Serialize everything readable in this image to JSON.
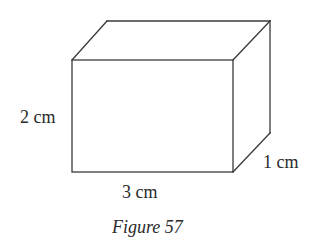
{
  "figure": {
    "caption": "Figure 57",
    "shape": "rectangular prism (cuboid)",
    "dimensions": {
      "height_label": "2 cm",
      "length_label": "3 cm",
      "depth_label": "1 cm"
    },
    "colors": {
      "line": "#3a3a3a",
      "text": "#2a2a2a",
      "background": "#ffffff"
    }
  }
}
